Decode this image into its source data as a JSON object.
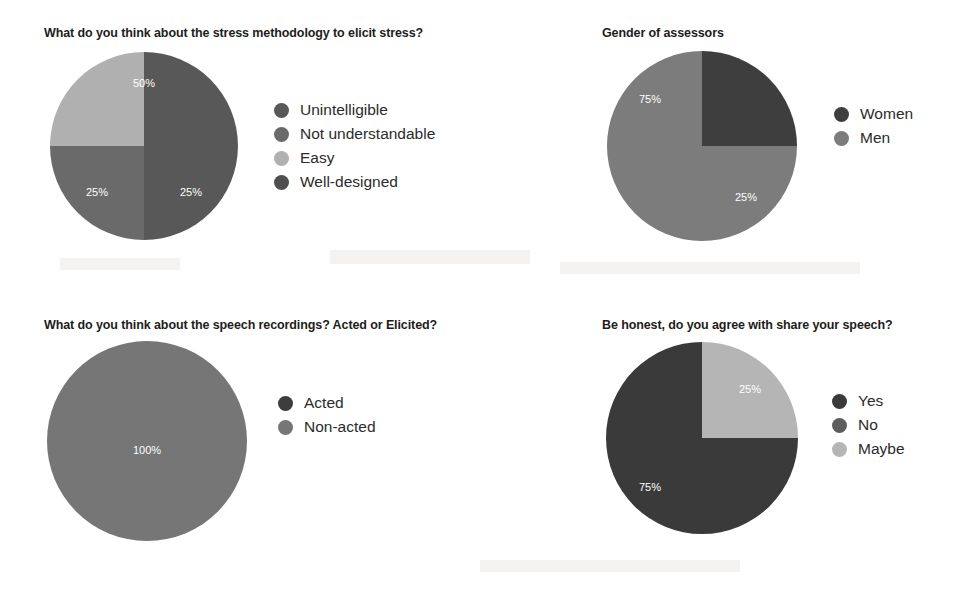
{
  "document": {
    "background_color": "#ffffff",
    "text_color": "#1d1d1b"
  },
  "panels": {
    "stress": {
      "title": "What do you think about the stress methodology to elicit stress?"
    },
    "gender": {
      "title": "Gender of assessors"
    },
    "speech": {
      "title": "What do you think about the speech recordings? Acted or Elicited?"
    },
    "share": {
      "title": "Be honest, do you agree with share your speech?"
    }
  },
  "chart_data": [
    {
      "id": "stress",
      "type": "pie",
      "title": "What do you think about the stress methodology to elicit stress?",
      "categories": [
        "Unintelligible",
        "Not understandable",
        "Easy",
        "Well-designed"
      ],
      "values": [
        50,
        25,
        25,
        0
      ],
      "value_labels": [
        "50%",
        "25%",
        "25%",
        ""
      ],
      "colors": [
        "#585858",
        "#6a6a6a",
        "#b0b0b0",
        "#4f4f4f"
      ],
      "legend_position": "right",
      "radius": 94,
      "start_angle": 0,
      "slices": [
        {
          "label": "Unintelligible",
          "value": 50,
          "display": "50%",
          "color": "#585858",
          "label_x": 0,
          "label_y": -62
        },
        {
          "label": "Not understandable",
          "value": 25,
          "display": "25%",
          "color": "#6a6a6a",
          "label_x": 47,
          "label_y": 47
        },
        {
          "label": "Easy",
          "value": 25,
          "display": "25%",
          "color": "#b0b0b0",
          "label_x": -47,
          "label_y": 47
        },
        {
          "label": "Well-designed",
          "value": 0,
          "display": "",
          "color": "#4f4f4f",
          "label_x": 0,
          "label_y": 0
        }
      ]
    },
    {
      "id": "gender",
      "type": "pie",
      "title": "Gender of assessors",
      "categories": [
        "Women",
        "Men"
      ],
      "values": [
        25,
        75
      ],
      "value_labels": [
        "25%",
        "75%"
      ],
      "colors": [
        "#3e3e3e",
        "#7c7c7c"
      ],
      "legend_position": "right",
      "radius": 95,
      "slices": [
        {
          "label": "Women",
          "value": 25,
          "display": "25%",
          "color": "#3e3e3e",
          "label_x": 44,
          "label_y": 52
        },
        {
          "label": "Men",
          "value": 75,
          "display": "75%",
          "color": "#7c7c7c",
          "label_x": -52,
          "label_y": -46
        }
      ]
    },
    {
      "id": "speech",
      "type": "pie",
      "title": "What do you think about the speech recordings? Acted or Elicited?",
      "categories": [
        "Acted",
        "Non-acted"
      ],
      "values": [
        0,
        100
      ],
      "value_labels": [
        "",
        "100%"
      ],
      "colors": [
        "#3c3c3c",
        "#767676"
      ],
      "legend_position": "right",
      "radius": 100,
      "slices": [
        {
          "label": "Acted",
          "value": 0,
          "display": "",
          "color": "#3c3c3c",
          "label_x": 0,
          "label_y": 0
        },
        {
          "label": "Non-acted",
          "value": 100,
          "display": "100%",
          "color": "#767676",
          "label_x": 0,
          "label_y": 10
        }
      ]
    },
    {
      "id": "share",
      "type": "pie",
      "title": "Be honest, do you agree with share your speech?",
      "categories": [
        "Yes",
        "No",
        "Maybe"
      ],
      "values": [
        75,
        0,
        25
      ],
      "value_labels": [
        "75%",
        "",
        "25%"
      ],
      "colors": [
        "#3a3a3a",
        "#5e5e5e",
        "#b5b5b5"
      ],
      "legend_position": "right",
      "radius": 96,
      "slices": [
        {
          "label": "Maybe",
          "value": 25,
          "display": "25%",
          "color": "#b5b5b5",
          "label_x": 48,
          "label_y": -48
        },
        {
          "label": "Yes",
          "value": 75,
          "display": "75%",
          "color": "#3a3a3a",
          "label_x": -52,
          "label_y": 50
        },
        {
          "label": "No",
          "value": 0,
          "display": "",
          "color": "#5e5e5e",
          "label_x": 0,
          "label_y": 0
        }
      ]
    }
  ]
}
